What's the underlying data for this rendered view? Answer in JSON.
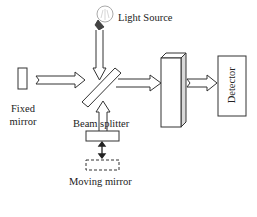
{
  "diagram": {
    "labels": {
      "light_source": "Light Source",
      "fixed_mirror_line1": "Fixed",
      "fixed_mirror_line2": "mirror",
      "beam_splitter": "Beam splitter",
      "moving_mirror": "Moving mirror",
      "detector": "Detector"
    },
    "components": [
      {
        "id": "light-source",
        "shape": "bulb"
      },
      {
        "id": "fixed-mirror",
        "shape": "rectangle"
      },
      {
        "id": "beam-splitter",
        "shape": "diagonal-plate"
      },
      {
        "id": "moving-mirror",
        "shape": "rectangle",
        "ghost_position": "dashed-rectangle"
      },
      {
        "id": "sample",
        "shape": "3d-box"
      },
      {
        "id": "detector",
        "shape": "rectangle"
      }
    ],
    "arrows": [
      {
        "from": "light-source",
        "to": "beam-splitter"
      },
      {
        "from": "fixed-mirror",
        "to": "beam-splitter"
      },
      {
        "from": "moving-mirror",
        "to": "beam-splitter"
      },
      {
        "from": "beam-splitter",
        "to": "sample"
      },
      {
        "from": "sample",
        "to": "detector"
      },
      {
        "from": "moving-mirror",
        "to": "moving-mirror-ghost",
        "style": "double-headed"
      }
    ],
    "colors": {
      "stroke": "#333333",
      "fill": "#ffffff",
      "sample_side": "#d9d9d9",
      "bulb_base": "#444444"
    }
  }
}
